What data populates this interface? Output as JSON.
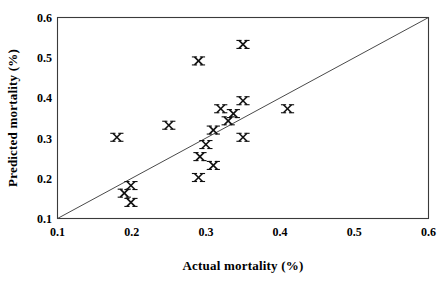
{
  "chart_data": {
    "type": "scatter",
    "title": "",
    "xlabel": "Actual mortality (%)",
    "ylabel": "Predicted mortality (%)",
    "xlim": [
      0.1,
      0.6
    ],
    "ylim": [
      0.1,
      0.6
    ],
    "xticks": [
      "0.1",
      "0.2",
      "0.3",
      "0.4",
      "0.5",
      "0.6"
    ],
    "yticks": [
      "0.1",
      "0.2",
      "0.3",
      "0.4",
      "0.5",
      "0.6"
    ],
    "xtick_values": [
      0.1,
      0.2,
      0.3,
      0.4,
      0.5,
      0.6
    ],
    "ytick_values": [
      0.1,
      0.2,
      0.3,
      0.4,
      0.5,
      0.6
    ],
    "grid": false,
    "legend": null,
    "marker_symbol": "x-cross",
    "marker_color": "#101010",
    "frame_color": "#3a3a3a",
    "identity_line": {
      "label": "1:1 line",
      "from": [
        0.1,
        0.1
      ],
      "to": [
        0.6,
        0.6
      ],
      "color": "#4a4a4a"
    },
    "points": [
      {
        "x": 0.18,
        "y": 0.302
      },
      {
        "x": 0.19,
        "y": 0.163
      },
      {
        "x": 0.199,
        "y": 0.182
      },
      {
        "x": 0.199,
        "y": 0.14
      },
      {
        "x": 0.25,
        "y": 0.332
      },
      {
        "x": 0.29,
        "y": 0.492
      },
      {
        "x": 0.29,
        "y": 0.202
      },
      {
        "x": 0.292,
        "y": 0.254
      },
      {
        "x": 0.3,
        "y": 0.284
      },
      {
        "x": 0.31,
        "y": 0.232
      },
      {
        "x": 0.31,
        "y": 0.32
      },
      {
        "x": 0.32,
        "y": 0.373
      },
      {
        "x": 0.33,
        "y": 0.343
      },
      {
        "x": 0.337,
        "y": 0.361
      },
      {
        "x": 0.35,
        "y": 0.533
      },
      {
        "x": 0.35,
        "y": 0.393
      },
      {
        "x": 0.35,
        "y": 0.302
      },
      {
        "x": 0.41,
        "y": 0.373
      }
    ]
  }
}
